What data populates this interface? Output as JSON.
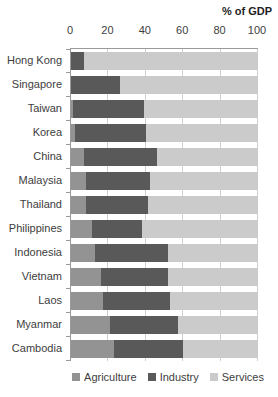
{
  "chart": {
    "title": "% of GDP"
  },
  "chart_data": {
    "type": "bar",
    "orientation": "horizontal",
    "stacked": true,
    "title": "% of GDP",
    "categories": [
      "Hong Kong",
      "Singapore",
      "Taiwan",
      "Korea",
      "China",
      "Malaysia",
      "Thailand",
      "Philippines",
      "Indonesia",
      "Vietnam",
      "Laos",
      "Myanmar",
      "Cambodia"
    ],
    "series": [
      {
        "name": "Agriculture",
        "color": "#939393",
        "values": [
          0,
          0,
          1,
          2,
          7,
          8,
          8,
          11,
          13,
          16,
          17,
          21,
          23
        ]
      },
      {
        "name": "Industry",
        "color": "#595959",
        "values": [
          7,
          26,
          38,
          38,
          39,
          34,
          33,
          27,
          39,
          36,
          36,
          36,
          37
        ]
      },
      {
        "name": "Services",
        "color": "#cbcbcb",
        "values": [
          93,
          74,
          61,
          60,
          54,
          58,
          59,
          62,
          48,
          48,
          47,
          43,
          40
        ]
      }
    ],
    "xlim": [
      0,
      100
    ],
    "xticks": [
      0,
      20,
      40,
      60,
      80,
      100
    ],
    "axis_position": "top",
    "legend_position": "bottom",
    "legend_labels": [
      "Agriculture",
      "Industry",
      "Services"
    ],
    "grid": true
  },
  "style": {
    "axis_color": "#9a9a9a",
    "grid_color": "#cfcfcf",
    "text_color": "#3d3d3d",
    "background": "#ffffff"
  }
}
